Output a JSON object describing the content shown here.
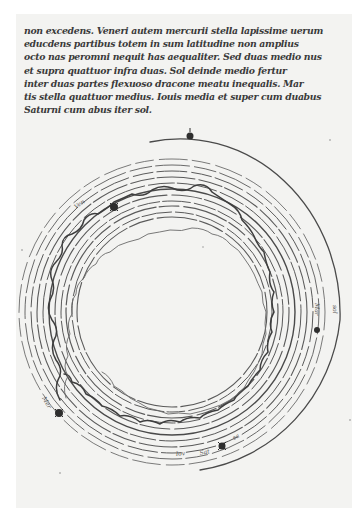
{
  "manuscript": {
    "text_lines": [
      "non excedens. Veneri autem mercurii stella lapissime uerum en",
      "educdens partibus totem in sum latitudine non amplius",
      "octo nas peromni nequit has aequaliter. Sed duas medio nus",
      "et supra quattuor infra duas. Sol deinde medio fertur",
      "inter duas partes flexuoso dracone meatu inequalis. Mar",
      "tis stella quattuor medius. Iouis media et super cum duabus",
      "Saturni cum abus iter sol."
    ]
  },
  "diagram": {
    "labels": [
      {
        "text": "Ven",
        "position": "upper-left"
      },
      {
        "text": "Mer",
        "position": "lower-left"
      },
      {
        "text": "Iov",
        "position": "bottom"
      },
      {
        "text": "Sat",
        "position": "bottom-right"
      },
      {
        "text": "Mar",
        "position": "right"
      },
      {
        "text": "sol",
        "position": "far-right"
      }
    ],
    "ink_color": "#4a4a4a",
    "paper_color": "#f3f3f1"
  }
}
